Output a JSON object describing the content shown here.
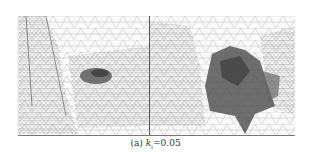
{
  "figure": {
    "panels": [
      {
        "id": "left",
        "description": "wireframe triangle mesh with small dark reconstructed patch"
      },
      {
        "id": "right",
        "description": "wireframe triangle mesh with large dark reconstructed surface"
      }
    ],
    "caption": {
      "label": "(a)",
      "symbol": "k",
      "subscript": "i",
      "equals": "=",
      "value": "0.05"
    }
  }
}
